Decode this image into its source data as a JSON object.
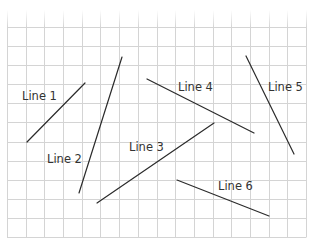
{
  "diagram": {
    "type": "grid-with-line-segments",
    "grid": {
      "x0": 7,
      "x1": 306,
      "cols": 16,
      "y0": 27,
      "y1": 237,
      "rows": 11,
      "fade_top": 10,
      "color": "#d4d4d4"
    },
    "line_color": "#2b2b2b",
    "segments": [
      {
        "id": "line-1",
        "label": "Line 1",
        "x1": 27,
        "y1": 142,
        "x2": 85,
        "y2": 83,
        "label_x": 22,
        "label_y": 100
      },
      {
        "id": "line-2",
        "label": "Line 2",
        "x1": 122,
        "y1": 57,
        "x2": 79,
        "y2": 193,
        "label_x": 47,
        "label_y": 163
      },
      {
        "id": "line-3",
        "label": "Line 3",
        "x1": 97,
        "y1": 203,
        "x2": 214,
        "y2": 123,
        "label_x": 129,
        "label_y": 151
      },
      {
        "id": "line-4",
        "label": "Line 4",
        "x1": 147,
        "y1": 79,
        "x2": 254,
        "y2": 133,
        "label_x": 178,
        "label_y": 91
      },
      {
        "id": "line-5",
        "label": "Line 5",
        "x1": 246,
        "y1": 56,
        "x2": 294,
        "y2": 154,
        "label_x": 268,
        "label_y": 91
      },
      {
        "id": "line-6",
        "label": "Line 6",
        "x1": 177,
        "y1": 180,
        "x2": 269,
        "y2": 216,
        "label_x": 218,
        "label_y": 190
      }
    ]
  }
}
